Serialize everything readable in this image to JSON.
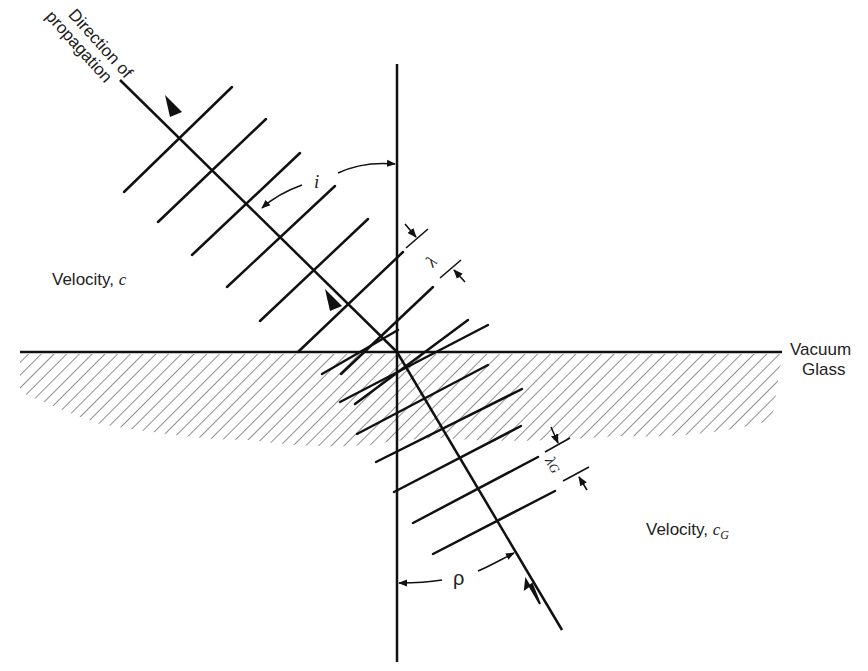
{
  "figure": {
    "labels": {
      "direction_line1": "Direction of",
      "direction_line2": "propagation",
      "velocity_vacuum_prefix": "Velocity,",
      "velocity_vacuum_symbol": "c",
      "velocity_glass_prefix": "Velocity,",
      "velocity_glass_symbol": "c",
      "velocity_glass_subscript": "G",
      "medium_upper": "Vacuum",
      "medium_lower": "Glass",
      "angle_incidence": "i",
      "angle_refraction": "ρ",
      "wavelength_vacuum": "λ",
      "wavelength_glass": "λ",
      "wavelength_glass_subscript": "G"
    },
    "colors": {
      "line": "#111111",
      "hatch": "#444444",
      "background": "#ffffff"
    },
    "elements": {
      "normal_line": "vertical normal to interface",
      "interface_line": "horizontal vacuum/glass boundary",
      "incident_ray": "arrowed ray in vacuum",
      "refracted_ray": "arrowed ray in glass",
      "wavefronts_vacuum_count": 7,
      "wavefronts_glass_count": 7
    }
  }
}
